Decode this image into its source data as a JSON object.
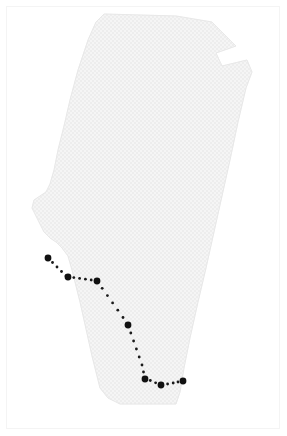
{
  "figure": {
    "width": 287,
    "height": 436,
    "background_color": "#ffffff",
    "border_color": "#f4f4f4"
  },
  "region": {
    "name": "alberta-province-outline",
    "fill_color": "#f3f3f3",
    "outline_color": "#eaeaea",
    "texture": "fine-grid-halftone",
    "outline_points": "104,14 176,16 212,22 236,46 216,53 222,66 247,60 252,72 246,88 238,122 230,160 222,196 214,232 206,268 198,302 190,338 184,368 180,392 176,404 120,404 108,398 100,388 96,372 92,356 88,338 84,320 80,302 76,286 72,270 68,256 62,248 56,242 50,238 44,232 40,224 36,216 32,208 34,200 40,196 46,192 50,184 54,170 58,150 64,126 70,100 78,70 88,40 96,22"
  },
  "route": {
    "name": "dotted-travel-route",
    "dot_color": "#1a1a1a",
    "marker_color": "#111111",
    "small_dot_radius": 1.4,
    "marker_radius": 3.4,
    "waypoints": [
      {
        "id": "wp-1",
        "x": 48,
        "y": 258
      },
      {
        "id": "wp-2",
        "x": 68,
        "y": 277
      },
      {
        "id": "wp-3",
        "x": 97,
        "y": 281
      },
      {
        "id": "wp-4",
        "x": 128,
        "y": 325
      },
      {
        "id": "wp-5",
        "x": 145,
        "y": 379
      },
      {
        "id": "wp-6",
        "x": 161,
        "y": 385
      },
      {
        "id": "wp-7",
        "x": 183,
        "y": 381
      }
    ],
    "trail_dots": [
      {
        "x": 52.5,
        "y": 262.5
      },
      {
        "x": 57.0,
        "y": 267.0
      },
      {
        "x": 61.5,
        "y": 271.5
      },
      {
        "x": 66.0,
        "y": 276.0
      },
      {
        "x": 73.8,
        "y": 277.6
      },
      {
        "x": 79.6,
        "y": 278.4
      },
      {
        "x": 85.4,
        "y": 279.2
      },
      {
        "x": 91.2,
        "y": 280.0
      },
      {
        "x": 102.2,
        "y": 288.3
      },
      {
        "x": 107.4,
        "y": 295.6
      },
      {
        "x": 112.6,
        "y": 302.9
      },
      {
        "x": 117.8,
        "y": 310.2
      },
      {
        "x": 123.0,
        "y": 317.5
      },
      {
        "x": 130.8,
        "y": 333.0
      },
      {
        "x": 133.6,
        "y": 341.0
      },
      {
        "x": 136.4,
        "y": 349.0
      },
      {
        "x": 139.2,
        "y": 357.0
      },
      {
        "x": 142.0,
        "y": 365.0
      },
      {
        "x": 143.5,
        "y": 372.0
      },
      {
        "x": 150.3,
        "y": 380.5
      },
      {
        "x": 155.6,
        "y": 382.8
      },
      {
        "x": 167.6,
        "y": 384.0
      },
      {
        "x": 173.2,
        "y": 383.0
      },
      {
        "x": 178.0,
        "y": 382.0
      }
    ]
  }
}
